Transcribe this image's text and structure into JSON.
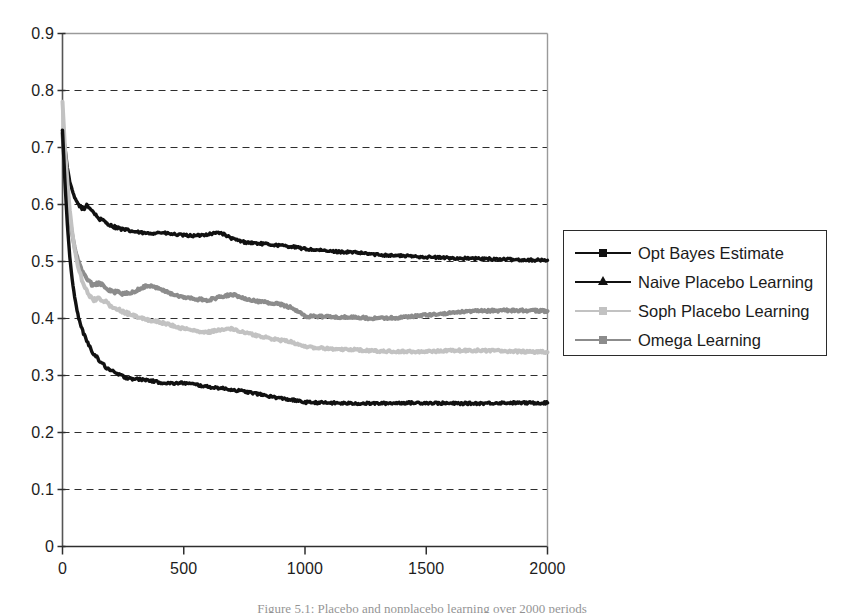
{
  "chart_data": {
    "type": "line",
    "title": "",
    "xlabel": "",
    "ylabel": "",
    "xlim": [
      0,
      2000
    ],
    "ylim": [
      0,
      0.9
    ],
    "grid": "horizontal-dashed",
    "legend_position": "right",
    "x_ticks": [
      "0",
      "500",
      "1000",
      "1500",
      "2000"
    ],
    "x_tick_values": [
      0,
      500,
      1000,
      1500,
      2000
    ],
    "y_ticks": [
      "0",
      "0.1",
      "0.2",
      "0.3",
      "0.4",
      "0.5",
      "0.6",
      "0.7",
      "0.8",
      "0.9"
    ],
    "y_tick_values": [
      0,
      0.1,
      0.2,
      0.3,
      0.4,
      0.5,
      0.6,
      0.7,
      0.8,
      0.9
    ],
    "x": [
      0,
      10,
      20,
      30,
      40,
      50,
      60,
      70,
      80,
      90,
      100,
      125,
      150,
      175,
      200,
      250,
      300,
      350,
      400,
      450,
      500,
      550,
      600,
      650,
      700,
      750,
      800,
      850,
      900,
      950,
      1000,
      1100,
      1200,
      1300,
      1400,
      1500,
      1600,
      1700,
      1800,
      1900,
      2000
    ],
    "series": [
      {
        "name": "Naive Placebo Learning",
        "color": "#111111",
        "marker": "triangle",
        "values": [
          0.73,
          0.7,
          0.665,
          0.64,
          0.625,
          0.612,
          0.604,
          0.598,
          0.594,
          0.592,
          0.6,
          0.588,
          0.575,
          0.57,
          0.563,
          0.556,
          0.552,
          0.549,
          0.551,
          0.548,
          0.546,
          0.545,
          0.548,
          0.551,
          0.54,
          0.534,
          0.532,
          0.53,
          0.528,
          0.526,
          0.522,
          0.518,
          0.516,
          0.512,
          0.51,
          0.508,
          0.506,
          0.505,
          0.504,
          0.503,
          0.502
        ]
      },
      {
        "name": "Omega Learning",
        "color": "#8c8c8c",
        "marker": "square",
        "values": [
          0.725,
          0.66,
          0.61,
          0.575,
          0.548,
          0.525,
          0.508,
          0.494,
          0.484,
          0.476,
          0.47,
          0.458,
          0.462,
          0.456,
          0.448,
          0.444,
          0.448,
          0.458,
          0.452,
          0.443,
          0.437,
          0.434,
          0.432,
          0.438,
          0.442,
          0.436,
          0.43,
          0.428,
          0.425,
          0.418,
          0.404,
          0.403,
          0.402,
          0.4,
          0.402,
          0.406,
          0.41,
          0.413,
          0.414,
          0.414,
          0.413
        ]
      },
      {
        "name": "Soph Placebo Learning",
        "color": "#c2c2c2",
        "marker": "square",
        "values": [
          0.78,
          0.7,
          0.64,
          0.59,
          0.552,
          0.522,
          0.5,
          0.482,
          0.468,
          0.457,
          0.448,
          0.432,
          0.436,
          0.43,
          0.422,
          0.412,
          0.404,
          0.398,
          0.394,
          0.388,
          0.382,
          0.378,
          0.376,
          0.38,
          0.382,
          0.376,
          0.37,
          0.366,
          0.362,
          0.358,
          0.35,
          0.347,
          0.345,
          0.343,
          0.342,
          0.342,
          0.344,
          0.344,
          0.343,
          0.342,
          0.341
        ]
      },
      {
        "name": "Opt Bayes Estimate",
        "color": "#111111",
        "marker": "square",
        "values": [
          0.73,
          0.64,
          0.565,
          0.508,
          0.468,
          0.438,
          0.414,
          0.396,
          0.382,
          0.37,
          0.36,
          0.341,
          0.327,
          0.316,
          0.308,
          0.298,
          0.294,
          0.292,
          0.288,
          0.286,
          0.287,
          0.284,
          0.28,
          0.278,
          0.275,
          0.272,
          0.268,
          0.264,
          0.26,
          0.257,
          0.253,
          0.252,
          0.251,
          0.251,
          0.252,
          0.252,
          0.251,
          0.251,
          0.252,
          0.252,
          0.252
        ]
      }
    ]
  },
  "legend": {
    "entries": [
      {
        "label": "Opt Bayes Estimate",
        "color": "#111111",
        "marker": "square"
      },
      {
        "label": "Naive Placebo Learning",
        "color": "#111111",
        "marker": "triangle"
      },
      {
        "label": "Soph Placebo Learning",
        "color": "#c2c2c2",
        "marker": "square"
      },
      {
        "label": "Omega Learning",
        "color": "#8c8c8c",
        "marker": "square"
      }
    ]
  },
  "caption": {
    "text": "Figure 5.1: Placebo and nonplacebo learning over 2000 periods"
  }
}
